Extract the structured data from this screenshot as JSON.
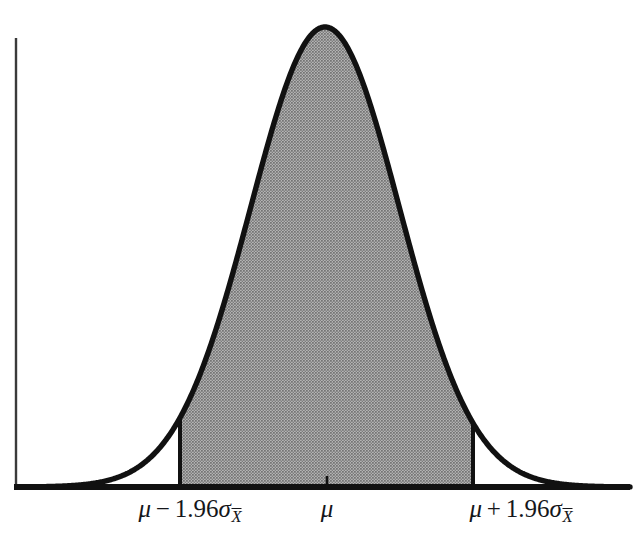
{
  "figure": {
    "background_color": "#ffffff",
    "axis_color": "#111111",
    "curve_color": "#111111",
    "shade_color": "#999999",
    "label_color": "#15161a"
  },
  "axes": {
    "x_axis": {
      "x_start": 16,
      "x_end": 630,
      "y": 487,
      "thickness": 6
    },
    "y_axis": {
      "x": 16,
      "y_start": 38,
      "y_end": 487,
      "thickness": 2
    },
    "center_tick": {
      "x": 327,
      "height": 11
    }
  },
  "labels": {
    "lower_bound": {
      "mu": "μ",
      "operator": "−",
      "coefficient": "1.96",
      "sigma": "σ",
      "subscript": "X",
      "full_text": "μ − 1.96σX̅",
      "x": 190
    },
    "center": {
      "mu": "μ",
      "full_text": "μ",
      "x": 327
    },
    "upper_bound": {
      "mu": "μ",
      "operator": "+",
      "coefficient": "1.96",
      "sigma": "σ",
      "subscript": "X",
      "full_text": "μ + 1.96σX̅",
      "x": 521
    }
  },
  "chart_data": {
    "type": "area",
    "title": "",
    "subtitle": "",
    "xlabel": "",
    "ylabel": "",
    "grid": false,
    "legend": null,
    "distribution": "normal",
    "mean_pixel_x": 325,
    "peak_pixel_y": 27,
    "baseline_pixel_y": 487,
    "sigma_pixel": 74.5,
    "shaded_interval": {
      "lower_pixel_x": 180,
      "upper_pixel_x": 473,
      "lower_z": -1.96,
      "upper_z": 1.96,
      "area_proportion": 0.95
    },
    "annotations": [
      "μ − 1.96σX̅",
      "μ",
      "μ + 1.96σX̅"
    ],
    "x": [
      -4.15,
      -3.9,
      -3.65,
      -3.4,
      -3.15,
      -2.9,
      -2.65,
      -2.4,
      -2.15,
      -1.96,
      -1.9,
      -1.65,
      -1.4,
      -1.15,
      -0.9,
      -0.65,
      -0.4,
      -0.15,
      0,
      0.15,
      0.4,
      0.65,
      0.9,
      1.15,
      1.4,
      1.65,
      1.9,
      1.96,
      2.15,
      2.4,
      2.65,
      2.9,
      3.15,
      3.4,
      3.65,
      3.9,
      4.1
    ],
    "y": [
      0.0001,
      0.0002,
      0.0006,
      0.0012,
      0.0028,
      0.006,
      0.0119,
      0.0224,
      0.0396,
      0.0584,
      0.0656,
      0.1023,
      0.1497,
      0.2059,
      0.2661,
      0.323,
      0.3683,
      0.3956,
      0.3989,
      0.3956,
      0.3683,
      0.323,
      0.2661,
      0.2059,
      0.1497,
      0.1023,
      0.0656,
      0.0584,
      0.0396,
      0.0224,
      0.0119,
      0.006,
      0.0028,
      0.0012,
      0.0006,
      0.0002,
      0.0001
    ],
    "xlim": [
      -4.15,
      4.1
    ],
    "ylim": [
      0,
      0.4
    ]
  }
}
